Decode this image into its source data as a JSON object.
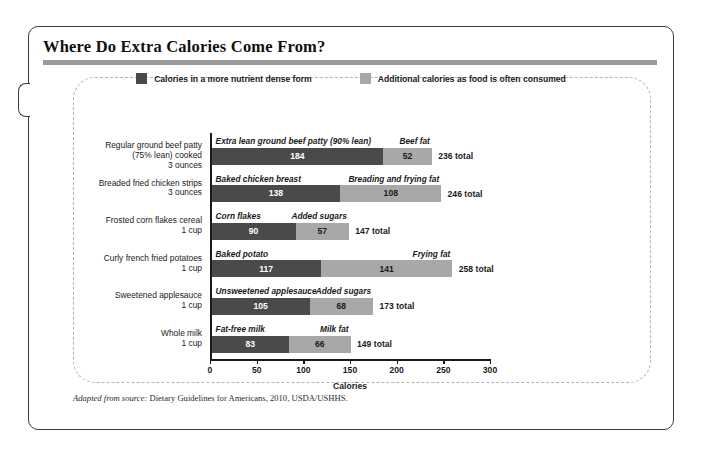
{
  "figure": {
    "title": "Where Do Extra Calories Come From?",
    "source_lead": "Adapted from source:",
    "source_text": " Dietary Guidelines for Americans, 2010, USDA/USHHS."
  },
  "legend": {
    "items": [
      {
        "label": "Calories in a more nutrient dense form",
        "color": "#4a4a4a"
      },
      {
        "label": "Additional calories as food is often consumed",
        "color": "#a8a8a8"
      }
    ]
  },
  "colors": {
    "dark_segment": "#4a4a4a",
    "light_segment": "#a8a8a8",
    "title_rule": "#9a9a9a",
    "frame": "#3c3c3c",
    "dashed_panel": "#b4b4b4"
  },
  "chart_data": {
    "type": "bar",
    "orientation": "horizontal",
    "stacked": true,
    "title": "Where Do Extra Calories Come From?",
    "xlabel": "Calories",
    "ylabel": "",
    "xlim": [
      0,
      300
    ],
    "xticks": [
      0,
      50,
      100,
      150,
      200,
      250,
      300
    ],
    "xticklabels": [
      "0",
      "50",
      "100",
      "150",
      "200",
      "250",
      "300"
    ],
    "grid": false,
    "legend_position": "top-center",
    "categories": [
      "Regular ground beef patty (75% lean) cooked 3 ounces",
      "Breaded fried chicken strips 3 ounces",
      "Frosted corn flakes cereal 1 cup",
      "Curly french fried potatoes 1 cup",
      "Sweetened applesauce 1 cup",
      "Whole milk 1 cup"
    ],
    "series": [
      {
        "name": "Calories in a more nutrient dense form",
        "values": [
          184,
          138,
          90,
          117,
          105,
          83
        ]
      },
      {
        "name": "Additional calories as food is often consumed",
        "values": [
          52,
          108,
          57,
          141,
          68,
          66
        ]
      }
    ],
    "totals": [
      236,
      246,
      147,
      258,
      173,
      149
    ]
  },
  "rows": [
    {
      "category_lines": [
        "Regular ground beef patty",
        "(75% lean) cooked",
        "3 ounces"
      ],
      "base_name": "Extra lean ground beef patty (90% lean)",
      "base_value": 184,
      "extra_name": "Beef fat",
      "extra_value": 52,
      "total_label": "236 total"
    },
    {
      "category_lines": [
        "Breaded fried chicken strips",
        "3 ounces"
      ],
      "base_name": "Baked chicken breast",
      "base_value": 138,
      "extra_name": "Breading and frying fat",
      "extra_value": 108,
      "total_label": "246 total"
    },
    {
      "category_lines": [
        "Frosted corn flakes cereal",
        "1 cup"
      ],
      "base_name": "Corn flakes",
      "base_value": 90,
      "extra_name": "Added sugars",
      "extra_value": 57,
      "total_label": "147 total"
    },
    {
      "category_lines": [
        "Curly french fried potatoes",
        "1 cup"
      ],
      "base_name": "Baked potato",
      "base_value": 117,
      "extra_name": "Frying fat",
      "extra_value": 141,
      "total_label": "258 total"
    },
    {
      "category_lines": [
        "Sweetened applesauce",
        "1 cup"
      ],
      "base_name": "Unsweetened applesauce",
      "base_value": 105,
      "extra_name": "Added sugars",
      "extra_value": 68,
      "total_label": "173 total"
    },
    {
      "category_lines": [
        "Whole milk",
        "1 cup"
      ],
      "base_name": "Fat-free milk",
      "base_value": 83,
      "extra_name": "Milk fat",
      "extra_value": 66,
      "total_label": "149 total"
    }
  ]
}
